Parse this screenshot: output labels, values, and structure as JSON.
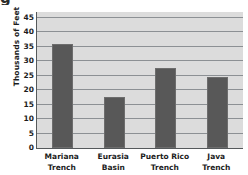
{
  "chart_data": {
    "type": "bar",
    "title": "",
    "cropped_title_fragment": "g",
    "xlabel": "",
    "ylabel": "Thousands of Feet",
    "categories": [
      "Mariana Trench",
      "Eurasia Basin",
      "Puerto Rico Trench",
      "Java Trench"
    ],
    "category_lines": [
      [
        "Mariana",
        "Trench"
      ],
      [
        "Eurasia",
        "Basin"
      ],
      [
        "Puerto Rico",
        "Trench"
      ],
      [
        "Java",
        "Trench"
      ]
    ],
    "values": [
      35.8,
      17.5,
      27.5,
      24.5
    ],
    "ylim": [
      0,
      47
    ],
    "yticks": [
      0,
      5,
      10,
      15,
      20,
      25,
      30,
      35,
      40,
      45
    ],
    "ytick_labels": [
      "0",
      "5",
      "10",
      "15",
      "20",
      "25",
      "30",
      "35",
      "40",
      "45"
    ],
    "grid": true,
    "legend": null,
    "colors": {
      "bar": "#585858",
      "bar_edge": "#6d6d6d",
      "plot_background": "#dcdcdc",
      "gridline": "#8c9094",
      "axis": "#55595b",
      "text": "#1c1c1c",
      "page_background": "#ffffff"
    }
  }
}
